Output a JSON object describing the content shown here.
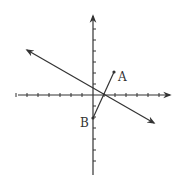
{
  "diagram": {
    "type": "coordinate-plane",
    "origin_px": [
      93,
      95
    ],
    "unit_px": 11,
    "x_ticks": [
      -7,
      -6,
      -5,
      -4,
      -3,
      -2,
      -1,
      1,
      2,
      3,
      4,
      5,
      6,
      7
    ],
    "y_ticks": [
      7,
      6,
      5,
      4,
      3,
      2,
      1,
      -1,
      -2,
      -3,
      -4,
      -5,
      -6,
      -7
    ],
    "points": [
      {
        "label": "A",
        "x": 2,
        "y": 2
      },
      {
        "label": "B",
        "x": 0,
        "y": -2
      }
    ],
    "segment": {
      "from": "A",
      "to": "B"
    },
    "line": {
      "description": "line with arrows at both ends, negative slope",
      "through_px": [
        [
          25,
          49
        ],
        [
          155,
          124
        ]
      ]
    },
    "colors": {
      "stroke": "#333333",
      "background": "#ffffff"
    }
  },
  "labels": {
    "a": "A",
    "b": "B"
  }
}
